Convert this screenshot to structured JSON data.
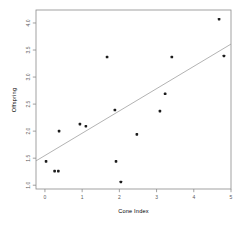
{
  "figure": {
    "width": 245,
    "height": 228,
    "background": "#ffffff"
  },
  "chart_data": {
    "type": "scatter",
    "title": "",
    "xlabel": "Cone Index",
    "ylabel": "Offspring",
    "xlim": [
      -0.24,
      5.0
    ],
    "ylim": [
      0.93,
      4.24
    ],
    "x_ticks": [
      0,
      1,
      2,
      3,
      4,
      5
    ],
    "y_ticks": [
      1.0,
      1.5,
      2.0,
      2.5,
      3.0,
      3.5,
      4.0
    ],
    "grid": false,
    "legend_position": "none",
    "points": [
      [
        0.03,
        1.44
      ],
      [
        0.26,
        1.26
      ],
      [
        0.36,
        1.26
      ],
      [
        0.38,
        2.0
      ],
      [
        0.94,
        2.13
      ],
      [
        1.1,
        2.09
      ],
      [
        1.67,
        3.37
      ],
      [
        1.88,
        2.39
      ],
      [
        1.91,
        1.44
      ],
      [
        2.04,
        1.06
      ],
      [
        2.47,
        1.94
      ],
      [
        3.09,
        2.37
      ],
      [
        3.23,
        2.69
      ],
      [
        3.41,
        3.37
      ],
      [
        4.68,
        4.07
      ],
      [
        4.81,
        3.39
      ]
    ],
    "trend_line": {
      "x1": -0.24,
      "y1": 1.45,
      "x2": 5.0,
      "y2": 3.61
    },
    "colors": {
      "point": "#1c1c1c",
      "trend_line": "#9a9a9a",
      "axis": "#8a8a8a",
      "text": "#5a5a5a"
    }
  }
}
